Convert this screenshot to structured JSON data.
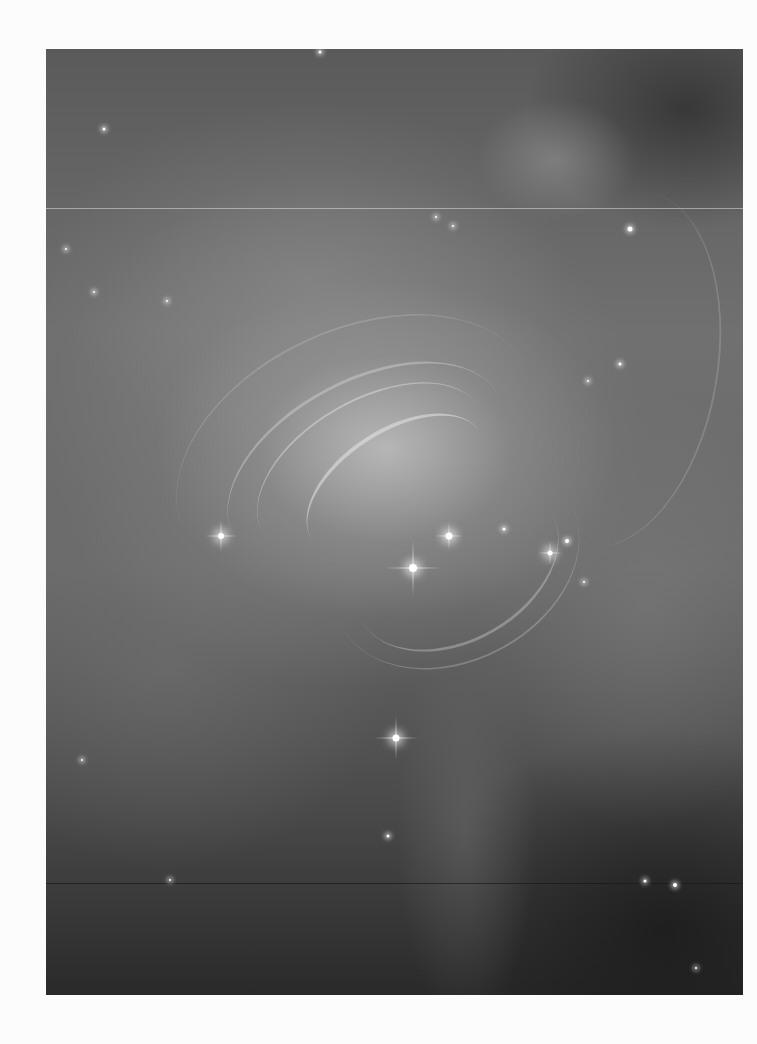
{
  "image": {
    "subject": "Crab Nebula pulsar region (grayscale astronomical photograph)",
    "colors": {
      "page_background": "#fcfcfc",
      "nebula_mid": "#707070",
      "nebula_dark": "#2a2a2a",
      "nebula_bright": "#c8c8c8",
      "star": "#ffffff"
    },
    "stars": [
      {
        "x": 274,
        "y": 3,
        "size": 3
      },
      {
        "x": 58,
        "y": 80,
        "size": 3
      },
      {
        "x": 20,
        "y": 200,
        "size": 2
      },
      {
        "x": 48,
        "y": 243,
        "size": 2
      },
      {
        "x": 407,
        "y": 177,
        "size": 2
      },
      {
        "x": 390,
        "y": 168,
        "size": 2
      },
      {
        "x": 584,
        "y": 180,
        "size": 5
      },
      {
        "x": 574,
        "y": 315,
        "size": 3
      },
      {
        "x": 542,
        "y": 332,
        "size": 2
      },
      {
        "x": 121,
        "y": 252,
        "size": 2
      },
      {
        "x": 175,
        "y": 487,
        "size": 6,
        "big": true,
        "spikes": 16
      },
      {
        "x": 367,
        "y": 519,
        "size": 8,
        "big": true,
        "spikes": 28
      },
      {
        "x": 403,
        "y": 487,
        "size": 7,
        "big": true,
        "spikes": 14
      },
      {
        "x": 458,
        "y": 480,
        "size": 3
      },
      {
        "x": 504,
        "y": 504,
        "size": 5,
        "big": true,
        "spikes": 12
      },
      {
        "x": 521,
        "y": 492,
        "size": 4
      },
      {
        "x": 350,
        "y": 689,
        "size": 7,
        "big": true,
        "spikes": 22
      },
      {
        "x": 36,
        "y": 711,
        "size": 2
      },
      {
        "x": 342,
        "y": 787,
        "size": 3
      },
      {
        "x": 599,
        "y": 832,
        "size": 3
      },
      {
        "x": 629,
        "y": 836,
        "size": 4
      },
      {
        "x": 124,
        "y": 831,
        "size": 2
      },
      {
        "x": 538,
        "y": 533,
        "size": 2
      },
      {
        "x": 650,
        "y": 919,
        "size": 2
      }
    ],
    "scanlines": [
      {
        "y": 159,
        "color": "rgba(220,220,220,0.55)"
      },
      {
        "y": 834,
        "color": "rgba(20,20,20,0.6)"
      }
    ]
  }
}
